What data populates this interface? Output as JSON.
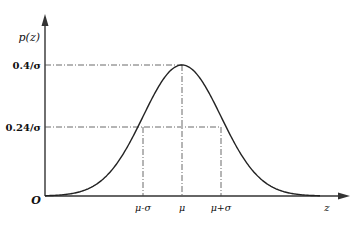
{
  "chart_data": {
    "type": "line",
    "title": "",
    "xlabel": "z",
    "ylabel": "p(z)",
    "origin_label": "O",
    "x_tick_labels": [
      "μ-σ",
      "μ",
      "μ+σ"
    ],
    "y_tick_labels": [
      "0.4/σ",
      "0.24/σ"
    ],
    "series": [
      {
        "name": "Gaussian probability density",
        "description": "Bell curve with peak 0.4/σ at z=μ and value 0.24/σ at z=μ±σ",
        "x": [
          "μ-3σ",
          "μ-2σ",
          "μ-σ",
          "μ",
          "μ+σ",
          "μ+2σ",
          "μ+3σ"
        ],
        "values": [
          "≈0",
          "0.054/σ",
          "0.24/σ",
          "0.4/σ",
          "0.24/σ",
          "0.054/σ",
          "≈0"
        ]
      }
    ],
    "annotations": [
      {
        "type": "dash-dot guide",
        "from": "0.4/σ on y-axis",
        "to": "peak at μ"
      },
      {
        "type": "dash-dot guide",
        "from": "0.24/σ on y-axis",
        "to": "μ+σ"
      },
      {
        "type": "dash-dot vertical",
        "at": "μ-σ"
      },
      {
        "type": "dash-dot vertical",
        "at": "μ"
      },
      {
        "type": "dash-dot vertical",
        "at": "μ+σ"
      }
    ],
    "grid": false,
    "legend": "none"
  },
  "labels": {
    "y_axis": "p(z)",
    "x_axis": "z",
    "origin": "O",
    "y_peak": "0.4/σ",
    "y_sigma": "0.24/σ",
    "x_minus": "μ-σ",
    "x_mu": "μ",
    "x_plus": "μ+σ"
  }
}
